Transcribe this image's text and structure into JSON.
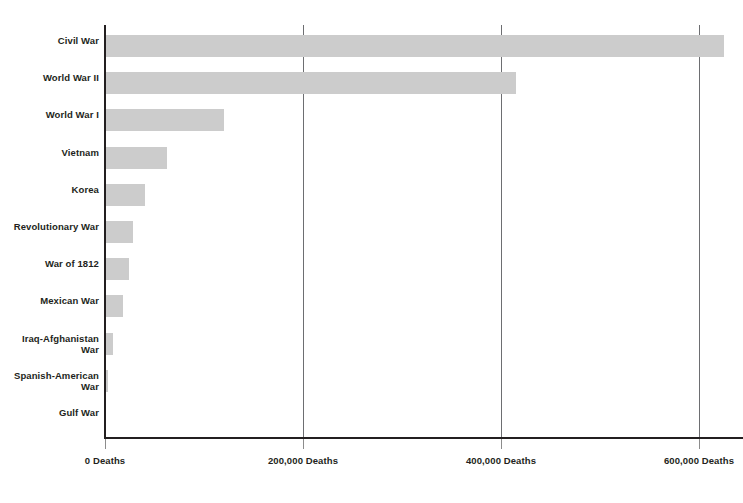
{
  "chart_data": {
    "type": "bar",
    "orientation": "horizontal",
    "title": "",
    "subtitle": "",
    "xlabel": "",
    "ylabel": "",
    "xlim": [
      0,
      644000
    ],
    "grid": true,
    "legend": null,
    "bar_color": "#cccccc",
    "axis_color": "#231f20",
    "gridline_color": "#6d6e71",
    "text_color": "#231f20",
    "background": "#ffffff",
    "unit_suffix": "Deaths",
    "categories": [
      "Civil War",
      "World War II",
      "World War I",
      "Vietnam",
      "Korea",
      "Revolutionary War",
      "War of 1812",
      "Mexican War",
      "Iraq-Afghanistan War",
      "Spanish-American War",
      "Gulf War"
    ],
    "values": [
      625000,
      415000,
      120000,
      63000,
      40000,
      28000,
      24000,
      18000,
      8000,
      3000,
      400
    ],
    "xticks": [
      0,
      200000,
      400000,
      600000
    ],
    "xticklabels": [
      "0 Deaths",
      "200,000 Deaths",
      "400,000 Deaths",
      "600,000 Deaths"
    ]
  }
}
